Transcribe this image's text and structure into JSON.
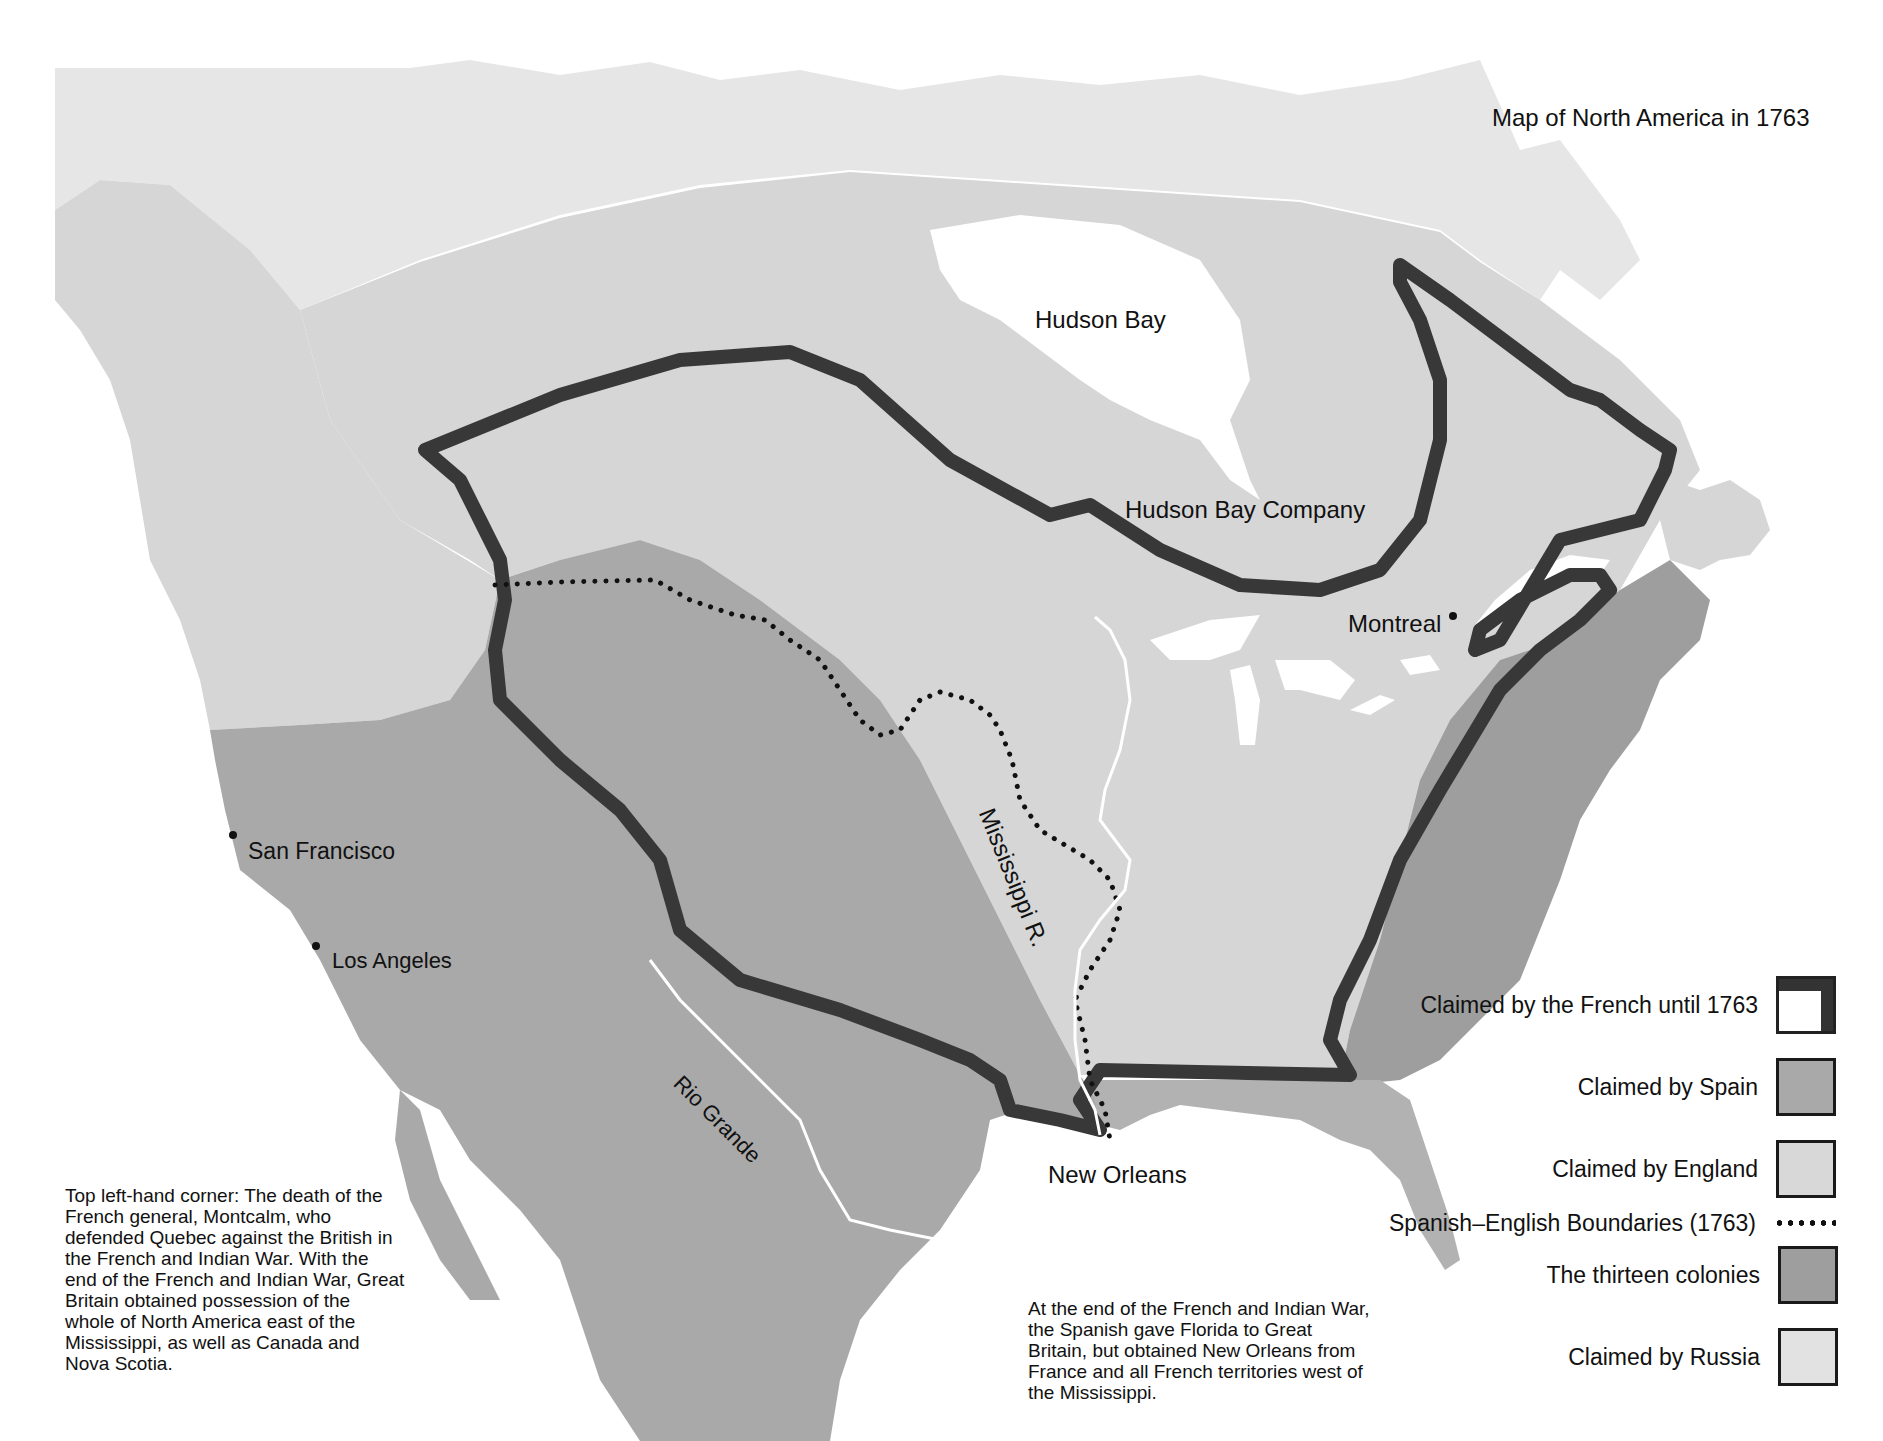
{
  "title": "Map of North America in 1763",
  "colors": {
    "russia": "#e6e6e6",
    "england": "#d8d8d8",
    "spain": "#a8a8a8",
    "colonies": "#9e9e9e",
    "french_border": "#383838",
    "water": "#ffffff",
    "boundary_dots": "#111111",
    "river": "#ffffff"
  },
  "places": {
    "hudson_bay": "Hudson Bay",
    "hudson_bay_company": "Hudson Bay Company",
    "montreal": "Montreal",
    "mississippi": "Mississippi R.",
    "san_francisco": "San Francisco",
    "los_angeles": "Los Angeles",
    "rio_grande": "Rio Grande",
    "new_orleans": "New Orleans"
  },
  "legend": {
    "items": [
      {
        "label": "Claimed by the French until 1763",
        "swatch": "french-outline"
      },
      {
        "label": "Claimed by Spain",
        "swatch": "spain"
      },
      {
        "label": "Claimed by England",
        "swatch": "england"
      },
      {
        "label": "Spanish–English Boundaries (1763)",
        "swatch": "dotted-line"
      },
      {
        "label": "The thirteen colonies",
        "swatch": "colonies"
      },
      {
        "label": "Claimed by Russia",
        "swatch": "russia"
      }
    ]
  },
  "captions": {
    "left": "Top left-hand corner: The death of the French general, Montcalm, who defended Quebec against the British in the French and Indian War. With the end of the French and Indian War, Great Britain obtained possession of the whole of North America east of the Mississippi, as well as Canada and Nova Scotia.",
    "bottom": "At the end of the French and Indian War, the Spanish gave Florida to Great Britain, but obtained New Orleans from France and all French territories west of the Mississippi."
  }
}
